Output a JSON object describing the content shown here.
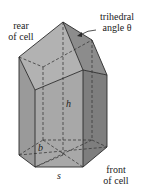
{
  "figure": {
    "colors": {
      "face_left": "#9a9a9a",
      "face_front": "#a8a8a8",
      "face_right": "#7e7e7e",
      "roof_left": "#b2b2b2",
      "roof_right": "#8c8c8c",
      "roof_front": "#9e9e9e",
      "edge": "#2a2a2a",
      "hidden_edge": "#3a3a3a"
    }
  },
  "labels": {
    "rear_line1": "rear",
    "rear_line2": "of cell",
    "trihedral_line1": "trihedral",
    "trihedral_line2": "angle θ",
    "front_line1": "front",
    "front_line2": "of cell"
  },
  "variables": {
    "height": "h",
    "base_height": "b",
    "side": "s"
  }
}
